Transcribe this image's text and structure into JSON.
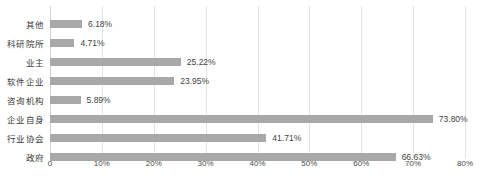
{
  "chart_data": {
    "type": "bar",
    "orientation": "horizontal",
    "title": "",
    "xlabel": "",
    "ylabel": "",
    "xlim": [
      0,
      80
    ],
    "grid": true,
    "legend": false,
    "tick_labels": [
      "0",
      "10%",
      "20%",
      "30%",
      "40%",
      "50%",
      "60%",
      "70%",
      "80%"
    ],
    "tick_values": [
      0,
      10,
      20,
      30,
      40,
      50,
      60,
      70,
      80
    ],
    "categories": [
      "其他",
      "科研院所",
      "业主",
      "软件企业",
      "咨询机构",
      "企业自身",
      "行业协会",
      "政府"
    ],
    "values": [
      6.18,
      4.71,
      25.22,
      23.95,
      5.89,
      73.8,
      41.71,
      66.63
    ],
    "value_labels": [
      "6.18%",
      "4.71%",
      "25.22%",
      "23.95%",
      "5.89%",
      "73.80%",
      "41.71%",
      "66.63%"
    ],
    "bar_color": "#a8a8a8",
    "grid_color": "#e4e4e4",
    "text_color": "#3a3a3a"
  },
  "caption": {
    "text": ""
  }
}
